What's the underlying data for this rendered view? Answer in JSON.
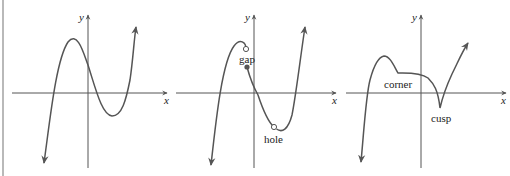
{
  "figure": {
    "panels": [
      {
        "id": "smooth",
        "axis_labels": {
          "x": "x",
          "y": "y"
        },
        "annotations": []
      },
      {
        "id": "gap-hole",
        "axis_labels": {
          "x": "x",
          "y": "y"
        },
        "annotations": [
          {
            "label": "gap"
          },
          {
            "label": "hole"
          }
        ]
      },
      {
        "id": "corner-cusp",
        "axis_labels": {
          "x": "x",
          "y": "y"
        },
        "annotations": [
          {
            "label": "corner"
          },
          {
            "label": "cusp"
          }
        ]
      }
    ],
    "colors": {
      "curve": "#555555",
      "axis": "#555555",
      "border": "#b9b9b9"
    }
  }
}
